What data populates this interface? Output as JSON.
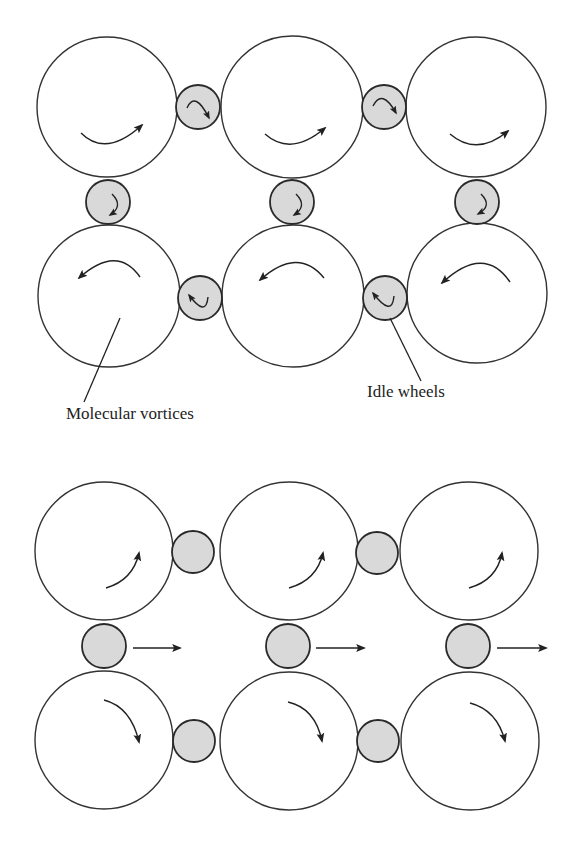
{
  "colors": {
    "vortex_fill": "#ffffff",
    "idle_wheel_fill": "#d9d9d9",
    "stroke": "#222222"
  },
  "labels": {
    "molecular_vortices": "Molecular vortices",
    "idle_wheels": "Idle wheels"
  },
  "diagrams": [
    {
      "id": "top",
      "state": "uniform rotation (no current)",
      "vortices": [
        {
          "row": 1,
          "col": 1,
          "rotation": "clockwise"
        },
        {
          "row": 1,
          "col": 2,
          "rotation": "clockwise"
        },
        {
          "row": 1,
          "col": 3,
          "rotation": "clockwise"
        },
        {
          "row": 2,
          "col": 1,
          "rotation": "counterclockwise"
        },
        {
          "row": 2,
          "col": 2,
          "rotation": "counterclockwise"
        },
        {
          "row": 2,
          "col": 3,
          "rotation": "counterclockwise"
        }
      ],
      "idle_wheels": [
        {
          "position": "between row1 col1-col2",
          "rotation": "counterclockwise"
        },
        {
          "position": "between row1 col2-col3",
          "rotation": "counterclockwise"
        },
        {
          "position": "between col1 row1-row2",
          "rotation": "counterclockwise"
        },
        {
          "position": "between col2 row1-row2",
          "rotation": "counterclockwise"
        },
        {
          "position": "between col3 row1-row2",
          "rotation": "counterclockwise"
        },
        {
          "position": "between row2 col1-col2",
          "rotation": "clockwise"
        },
        {
          "position": "between row2 col2-col3",
          "rotation": "clockwise"
        }
      ]
    },
    {
      "id": "bottom",
      "state": "differential rotation (current flows)",
      "vortices": [
        {
          "row": 1,
          "col": 1,
          "rotation": "counterclockwise"
        },
        {
          "row": 1,
          "col": 2,
          "rotation": "counterclockwise"
        },
        {
          "row": 1,
          "col": 3,
          "rotation": "counterclockwise"
        },
        {
          "row": 2,
          "col": 1,
          "rotation": "clockwise"
        },
        {
          "row": 2,
          "col": 2,
          "rotation": "clockwise"
        },
        {
          "row": 2,
          "col": 3,
          "rotation": "clockwise"
        }
      ],
      "idle_wheels_translation": "rightward",
      "idle_wheel_count": 7
    }
  ]
}
